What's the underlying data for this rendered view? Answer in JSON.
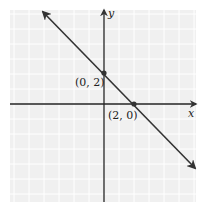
{
  "chart_data": {
    "type": "line",
    "title": "",
    "xlabel": "x",
    "ylabel": "y",
    "xlim": [
      -6,
      6
    ],
    "ylim": [
      -6,
      6
    ],
    "grid": true,
    "grid_step": 1,
    "series": [
      {
        "name": "line",
        "equation": "y = -x + 2",
        "x": [
          -3,
          0,
          2,
          6
        ],
        "y": [
          5,
          2,
          0,
          -4
        ]
      }
    ],
    "points": [
      {
        "x": 0,
        "y": 2,
        "label": "(0, 2)"
      },
      {
        "x": 2,
        "y": 0,
        "label": "(2, 0)"
      }
    ],
    "annotations": [
      "(0, 2)",
      "(2, 0)"
    ]
  },
  "labels": {
    "x_axis": "x",
    "y_axis": "y",
    "point_a": "(0, 2)",
    "point_b": "(2, 0)"
  },
  "colors": {
    "grid_bg": "#f2f2f2",
    "grid_line": "#ffffff",
    "axis": "#222222",
    "line": "#333333"
  }
}
